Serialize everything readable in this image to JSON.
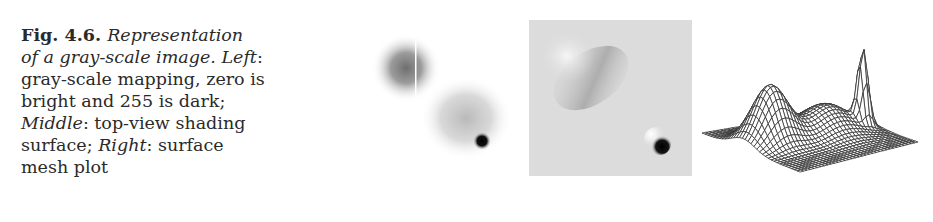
{
  "caption": {
    "figure_label": "Fig. 4.6.",
    "lines": [
      {
        "parts": [
          {
            "style": "bold",
            "text": "Fig. 4.6. "
          },
          {
            "style": "italic",
            "text": "Representation"
          }
        ]
      },
      {
        "parts": [
          {
            "style": "italic",
            "text": "of a gray-scale image. Left"
          },
          {
            "style": "normal",
            "text": ":"
          }
        ]
      },
      {
        "parts": [
          {
            "style": "normal",
            "text": "gray-scale mapping, zero is"
          }
        ]
      },
      {
        "parts": [
          {
            "style": "normal",
            "text": "bright and 255 is dark;"
          }
        ]
      },
      {
        "parts": [
          {
            "style": "italic",
            "text": "Middle"
          },
          {
            "style": "normal",
            "text": ": top-view shading"
          }
        ]
      },
      {
        "parts": [
          {
            "style": "normal",
            "text": "surface; "
          },
          {
            "style": "italic",
            "text": "Right"
          },
          {
            "style": "normal",
            "text": ": surface"
          }
        ]
      },
      {
        "parts": [
          {
            "style": "normal",
            "text": "mesh plot"
          }
        ]
      }
    ]
  },
  "panels": {
    "left": {
      "name": "gray-scale mapping",
      "mapping": "zero is bright, 255 is dark"
    },
    "middle": {
      "name": "top-view shading surface"
    },
    "right": {
      "name": "surface mesh plot"
    }
  },
  "colors": {
    "text": "#2a2a2a",
    "background": "#ffffff",
    "shading_bg": "#dcdcdc",
    "mesh": "#333333"
  }
}
